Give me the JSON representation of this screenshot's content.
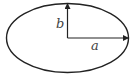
{
  "diagram": {
    "labels": {
      "semi_minor": "b",
      "semi_major": "a"
    },
    "colors": {
      "stroke": "#222222",
      "label": "#444444",
      "background": "#ffffff"
    }
  }
}
